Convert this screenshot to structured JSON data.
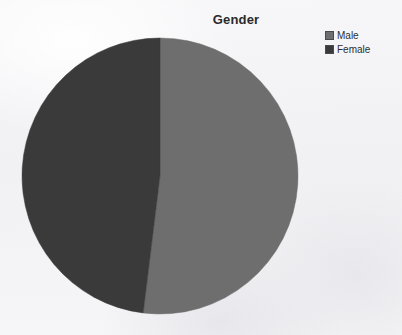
{
  "chart_data": {
    "type": "pie",
    "title": "Gender",
    "xlabel": "",
    "ylabel": "",
    "legend_position": "top-right",
    "grid": false,
    "start_angle_deg": 0,
    "direction": "clockwise",
    "categories": [
      "Male",
      "Female"
    ],
    "values": [
      52,
      48
    ],
    "value_unit": "percent",
    "slices": [
      {
        "label": "Male",
        "value": 52,
        "percent": 52,
        "sweep_deg": 187,
        "color": "#6e6e6e"
      },
      {
        "label": "Female",
        "value": 48,
        "percent": 48,
        "sweep_deg": 173,
        "color": "#3a3a3a"
      }
    ],
    "legend": [
      {
        "label": "Male",
        "color": "#6e6e6e"
      },
      {
        "label": "Female",
        "color": "#3a3a3a"
      }
    ]
  },
  "geometry": {
    "center_x": 139,
    "center_y": 143,
    "radius": 138
  },
  "colors": {
    "male": "#6e6e6e",
    "female": "#3a3a3a",
    "background": "#f4f4f6",
    "title_text": "#2a2a2a",
    "legend_text": "#2e2e2e",
    "swatch_border": "#4a4a4a"
  },
  "icons": {
    "male_swatch": "square-swatch-icon",
    "female_swatch": "square-swatch-icon"
  }
}
